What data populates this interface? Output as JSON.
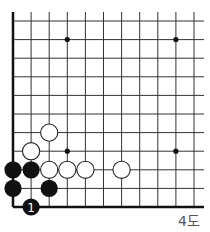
{
  "diagram": {
    "caption": "4도",
    "grid": {
      "origin_x": 13,
      "origin_y": 21,
      "cols": 11,
      "rows": 11,
      "spacing_x": 18.1,
      "spacing_y": 18.6,
      "top_extend": 12,
      "right_extend": 204,
      "line_color": "#333333",
      "edge_color": "#111111"
    },
    "star_points": [
      {
        "col": 3,
        "row": 1
      },
      {
        "col": 9,
        "row": 1
      },
      {
        "col": 3,
        "row": 7
      },
      {
        "col": 9,
        "row": 7
      }
    ],
    "stones": [
      {
        "color": "white",
        "col": 2,
        "row": 6
      },
      {
        "color": "white",
        "col": 1,
        "row": 7
      },
      {
        "color": "white",
        "col": 2,
        "row": 8
      },
      {
        "color": "white",
        "col": 3,
        "row": 8
      },
      {
        "color": "white",
        "col": 4,
        "row": 8
      },
      {
        "color": "white",
        "col": 6,
        "row": 8
      },
      {
        "color": "black",
        "col": 0,
        "row": 8
      },
      {
        "color": "black",
        "col": 1,
        "row": 8
      },
      {
        "color": "black",
        "col": 0,
        "row": 9
      },
      {
        "color": "black",
        "col": 2,
        "row": 9
      },
      {
        "color": "black",
        "col": 1,
        "row": 10,
        "label": "1"
      }
    ]
  }
}
